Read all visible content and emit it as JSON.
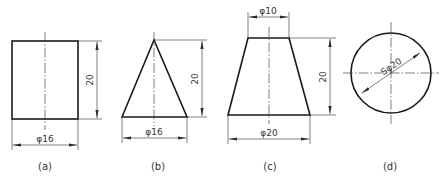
{
  "figures": [
    {
      "id": "a",
      "shape": "cylinder",
      "caption": "(a)",
      "dims": {
        "height": "20",
        "diameter": "φ16"
      }
    },
    {
      "id": "b",
      "shape": "cone",
      "caption": "(b)",
      "dims": {
        "height": "20",
        "diameter": "φ16"
      }
    },
    {
      "id": "c",
      "shape": "truncated-cone",
      "caption": "(c)",
      "dims": {
        "top_diameter": "φ10",
        "height": "20",
        "bottom_diameter": "φ20"
      }
    },
    {
      "id": "d",
      "shape": "sphere",
      "caption": "(d)",
      "dims": {
        "diameter": "Sφ20"
      }
    }
  ]
}
